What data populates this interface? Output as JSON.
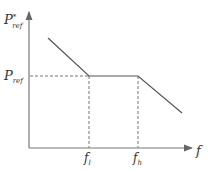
{
  "diagram": {
    "y_axis": {
      "label_main": "P",
      "label_sup": "*",
      "label_sub": "ref"
    },
    "x_axis": {
      "label": "f"
    },
    "level_label": {
      "main": "P",
      "sub": "ref"
    },
    "tick_labels": [
      {
        "main": "f",
        "sub": "l"
      },
      {
        "main": "f",
        "sub": "h"
      }
    ],
    "colors": {
      "line": "#555555",
      "axis": "#777777",
      "dash": "#777777",
      "text": "#333333"
    }
  }
}
